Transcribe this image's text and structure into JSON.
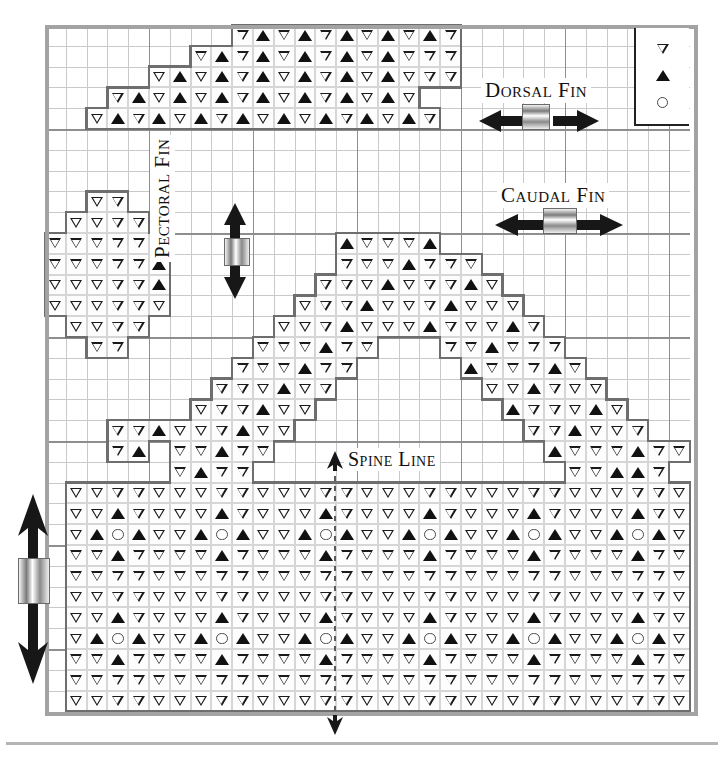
{
  "figure": {
    "type": "cross-stitch-pattern-chart",
    "grid": {
      "columns": 31,
      "rows": 33,
      "cell_px": 20.8,
      "major_every": 5
    }
  },
  "legend": {
    "title": "",
    "items": [
      {
        "symbol": "tri-open",
        "name": "open-down-triangle"
      },
      {
        "symbol": "tri-solid",
        "name": "solid-up-triangle"
      },
      {
        "symbol": "circ",
        "name": "open-circle"
      }
    ]
  },
  "labels": {
    "dorsal": "Dorsal Fin",
    "caudal": "Caudal Fin",
    "pectoral": "Pectoral Fin",
    "spine": "Spine Line"
  },
  "chart_data": {
    "type": "heatmap",
    "xlabel": "",
    "ylabel": "",
    "grid": true,
    "legend_position": "top-right",
    "symbols": {
      "o": "open-down-triangle",
      "x": "solid-up-triangle",
      "c": "open-circle",
      ".": "empty"
    },
    "regions": [
      {
        "name": "dorsal-fin",
        "origin_col": 2,
        "origin_row": 0,
        "rows": [
          "..........ooxoxoxoxox.",
          "......oox oxoxoxoxooo.",
          "......oooxoxoxoxoxoo..",
          "....ooxoxoxoxoxoxo....",
          "..oxoxoxoxoxoxoxoxox.."
        ]
      },
      {
        "name": "pectoral-fin",
        "origin_col": 1,
        "origin_row": 8,
        "rows": [
          "..oo..",
          ".oooo.",
          "oooooo",
          "ooooox",
          "ooooox",
          "oooooo",
          ".oooo.",
          "..oo.."
        ]
      },
      {
        "name": "body-arch",
        "origin_col": 5,
        "origin_row": 9,
        "note": "arched caudal/upper body band rising to a peak near column 16"
      },
      {
        "name": "body",
        "origin_col": 1,
        "origin_row": 22,
        "rows": 10,
        "cols": 30,
        "motif": "flower: solid triangles N,S,E,W around an open circle, repeated on a 5x5 lattice"
      }
    ]
  },
  "colors": {
    "grid_minor": "#c9c9c9",
    "grid_major": "#8e8e8e",
    "region_outline": "#6e6e6e",
    "frame": "#a3a3a3",
    "symbol": "#111111",
    "background": "#ffffff"
  }
}
